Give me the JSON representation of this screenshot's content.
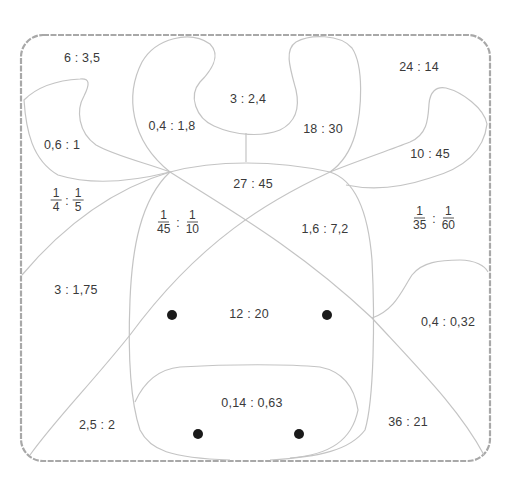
{
  "diagram": {
    "frame": {
      "x": 21,
      "y": 35,
      "width": 469,
      "height": 426,
      "radius": 22,
      "stroke": "#a8a8a8"
    },
    "line_color": "#c4c4c4",
    "regions": [
      {
        "id": "top-left-corner",
        "ratio": "6 : 3,5",
        "x": 82,
        "y": 58
      },
      {
        "id": "left-ear",
        "ratio": "0,6 : 1",
        "x": 62,
        "y": 145
      },
      {
        "id": "left-horn",
        "ratio": "0,4 : 1,8",
        "x": 172,
        "y": 126
      },
      {
        "id": "between-horns",
        "ratio": "3 : 2,4",
        "x": 248,
        "y": 99
      },
      {
        "id": "right-horn",
        "ratio": "18 : 30",
        "x": 323,
        "y": 129
      },
      {
        "id": "top-right-corner",
        "ratio": "24 : 14",
        "x": 419,
        "y": 67
      },
      {
        "id": "right-ear",
        "ratio": "10 : 45",
        "x": 430,
        "y": 154
      },
      {
        "id": "forehead",
        "ratio": "27 : 45",
        "x": 253,
        "y": 184
      },
      {
        "id": "left-cheek-upper",
        "ratio": "1,6 : 7,2",
        "x": 325,
        "y": 229
      },
      {
        "id": "left-side",
        "ratio": "3 : 1,75",
        "x": 76,
        "y": 290
      },
      {
        "id": "face-center",
        "ratio": "12 : 20",
        "x": 249,
        "y": 314
      },
      {
        "id": "right-side",
        "ratio": "0,4 : 0,32",
        "x": 448,
        "y": 322
      },
      {
        "id": "muzzle",
        "ratio": "0,14 : 0,63",
        "x": 252,
        "y": 403
      },
      {
        "id": "bottom-left",
        "ratio": "2,5 : 2",
        "x": 97,
        "y": 425
      },
      {
        "id": "bottom-right",
        "ratio": "36 : 21",
        "x": 408,
        "y": 422
      }
    ],
    "fraction_regions": [
      {
        "id": "left-of-head",
        "a_num": "1",
        "a_den": "4",
        "b_num": "1",
        "b_den": "5",
        "x": 67,
        "y": 200
      },
      {
        "id": "left-face",
        "a_num": "1",
        "a_den": "45",
        "b_num": "1",
        "b_den": "10",
        "x": 178,
        "y": 222
      },
      {
        "id": "right-of-head",
        "a_num": "1",
        "a_den": "35",
        "b_num": "1",
        "b_den": "60",
        "x": 434,
        "y": 218
      }
    ],
    "separator": ":",
    "eyes": [
      {
        "x": 172,
        "y": 315
      },
      {
        "x": 327,
        "y": 315
      }
    ],
    "nostrils": [
      {
        "x": 198,
        "y": 434
      },
      {
        "x": 299,
        "y": 434
      }
    ]
  }
}
